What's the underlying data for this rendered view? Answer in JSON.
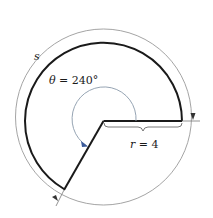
{
  "diagram": {
    "type": "circular-sector-arc-length",
    "labels": {
      "arc": "s",
      "angle_symbol": "θ",
      "angle_eq": " = 240°",
      "radius_symbol": "r",
      "radius_eq": " = 4"
    },
    "values": {
      "angle_degrees": 240,
      "radius": 4
    },
    "colors": {
      "sector_stroke": "#1a1a1a",
      "arc_measure": "#8a8a8a",
      "angle_arc": "#8a9aaa",
      "angle_arrow": "#3a5a9a"
    }
  }
}
